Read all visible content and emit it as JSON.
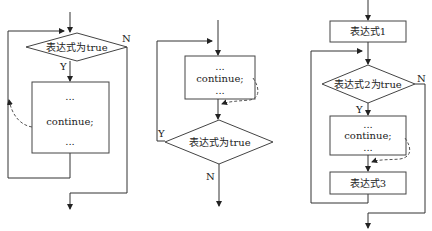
{
  "diagrams": [
    {
      "name": "while-loop",
      "condition": "表达式为true",
      "yes_label": "Y",
      "no_label": "N",
      "body": {
        "line1": "...",
        "line2": "continue;",
        "line3": "..."
      }
    },
    {
      "name": "do-while-loop",
      "condition": "表达式为true",
      "yes_label": "Y",
      "no_label": "N",
      "body": {
        "line1": "...",
        "line2": "continue;",
        "line3": "..."
      }
    },
    {
      "name": "for-loop",
      "init": "表达式1",
      "condition": "表达式2为true",
      "yes_label": "Y",
      "no_label": "N",
      "body": {
        "line1": "...",
        "line2": "continue;",
        "line3": "..."
      },
      "update": "表达式3"
    }
  ],
  "colors": {
    "line": "#333333",
    "background": "#ffffff"
  }
}
